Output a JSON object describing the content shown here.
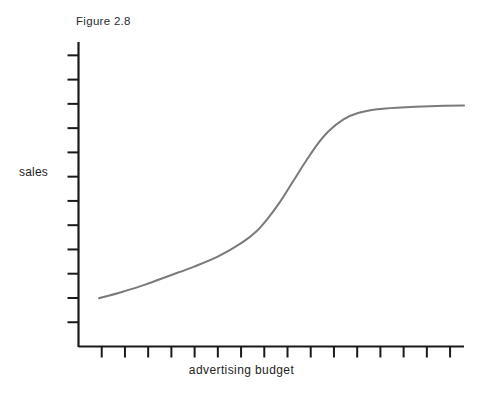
{
  "figure": {
    "caption": "Figure 2.8",
    "ylabel": "sales",
    "xlabel": "advertising budget"
  },
  "chart_data": {
    "type": "line",
    "title": "Figure 2.8",
    "subtitle": "",
    "xlabel": "advertising budget",
    "ylabel": "sales",
    "grid": false,
    "legend": null,
    "legend_position": "none",
    "axis_style": {
      "line_color": "#1a1a1a",
      "line_width": 2,
      "x_axis_ticks": 16,
      "y_axis_ticks": 12,
      "x_tick_direction": "outward-down",
      "y_tick_direction": "outward-left",
      "x_tick_labels": [],
      "y_tick_labels": [],
      "xlim": [
        0,
        16
      ],
      "ylim": [
        0,
        12
      ]
    },
    "series": [
      {
        "name": "sales response to advertising budget",
        "color": "#7a7a7a",
        "line_width": 2,
        "shape": "sigmoid (S-curve)",
        "x": [
          0.85,
          1.8,
          2.8,
          3.8,
          4.8,
          5.8,
          6.8,
          7.4,
          7.9,
          8.4,
          8.9,
          9.4,
          9.9,
          10.4,
          11.0,
          11.6,
          12.4,
          13.4,
          14.6,
          16.0
        ],
        "y": [
          1.9,
          2.15,
          2.45,
          2.8,
          3.15,
          3.55,
          4.1,
          4.55,
          5.1,
          5.75,
          6.5,
          7.25,
          7.95,
          8.5,
          8.95,
          9.2,
          9.35,
          9.42,
          9.47,
          9.5
        ]
      }
    ],
    "annotations": [
      "Curve rises slowly at low budget, steeply through the middle, then saturates (diminishing returns)."
    ]
  }
}
